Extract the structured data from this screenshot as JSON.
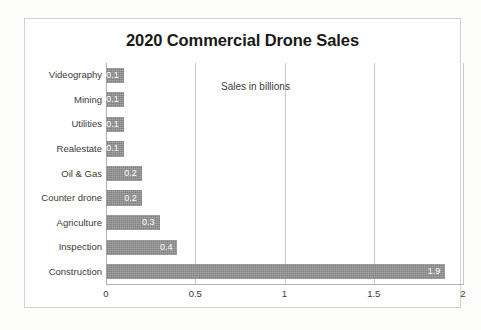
{
  "chart_data": {
    "type": "bar",
    "orientation": "horizontal",
    "title": "2020 Commercial Drone Sales",
    "annotation": "Sales in billions",
    "xlabel": "",
    "ylabel": "",
    "xlim": [
      0,
      2
    ],
    "xticks": [
      "0",
      "0.5",
      "1",
      "1.5",
      "2"
    ],
    "xtick_values": [
      0,
      0.5,
      1,
      1.5,
      2
    ],
    "grid": true,
    "grid_axis": "x",
    "legend": false,
    "bar_color": "#808080",
    "value_label_color": "#ffffff",
    "categories": [
      "Videography",
      "Mining",
      "Utilities",
      "Realestate",
      "Oil & Gas",
      "Counter drone",
      "Agriculture",
      "Inspection",
      "Construction"
    ],
    "values": [
      0.1,
      0.1,
      0.1,
      0.1,
      0.2,
      0.2,
      0.3,
      0.4,
      1.9
    ],
    "value_labels": [
      "0.1",
      "0.1",
      "0.1",
      "0.1",
      "0.2",
      "0.2",
      "0.3",
      "0.4",
      "1.9"
    ]
  }
}
